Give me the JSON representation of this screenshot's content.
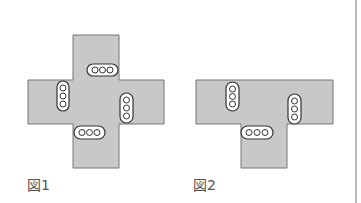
{
  "figures": [
    {
      "id": "fig1",
      "caption": "図1",
      "shape": "cross",
      "fill": "#c8c8c8",
      "stroke": "#777777",
      "pills": [
        {
          "orientation": "horizontal",
          "dots": 3
        },
        {
          "orientation": "vertical",
          "dots": 3
        },
        {
          "orientation": "vertical",
          "dots": 3
        },
        {
          "orientation": "horizontal",
          "dots": 3
        }
      ]
    },
    {
      "id": "fig2",
      "caption": "図2",
      "shape": "T",
      "fill": "#c8c8c8",
      "stroke": "#777777",
      "pills": [
        {
          "orientation": "vertical",
          "dots": 3
        },
        {
          "orientation": "vertical",
          "dots": 3
        },
        {
          "orientation": "horizontal",
          "dots": 3
        }
      ]
    }
  ],
  "colors": {
    "shape_fill": "#c8c8c8",
    "outline": "#666666",
    "divider": "#888888"
  }
}
